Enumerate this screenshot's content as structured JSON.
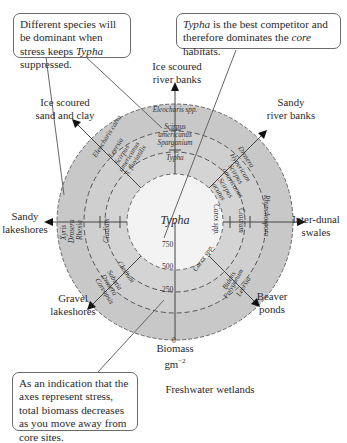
{
  "callouts": {
    "top_left": {
      "pre": "Different species will be dominant when stress keeps ",
      "em": "Typha",
      "post": " suppressed."
    },
    "top_right": {
      "em1": "Typha",
      "mid": " is the best competitor and therefore dominates the ",
      "em2": "core",
      "post": " habitats."
    },
    "bottom_left": {
      "text": "As an indication that the axes represent stress, total biomass decreases as you move away from core sites."
    }
  },
  "habitats": {
    "ice_river": {
      "line1": "Ice scoured",
      "line2": "river banks"
    },
    "sandy_river": {
      "line1": "Sandy",
      "line2": "river banks"
    },
    "ice_sand": {
      "line1": "Ice scoured",
      "line2": "sand and clay"
    },
    "sandy_lake": {
      "line1": "Sandy",
      "line2": "lakeshores"
    },
    "inter_dunal": {
      "line1": "Inter-dunal",
      "line2": "swales"
    },
    "gravel": {
      "line1": "Gravel",
      "line2": "lakeshores"
    },
    "beaver": {
      "line1": "Beaver",
      "line2": "ponds"
    }
  },
  "center_label": "Typha",
  "biomass_axis": {
    "label": "Biomass",
    "unit": "gm",
    "unit_sup": "−2",
    "ticks": [
      "750",
      "500",
      "250",
      "0"
    ]
  },
  "footer": "Freshwater wetlands",
  "species": {
    "n_outer": "Eleocharis spp.",
    "n_mid1": "Scirpus",
    "n_mid2": "americanus",
    "n_mid3": "Sparganium",
    "n_inner": "Typha",
    "nw_outer": "Eleocharis calva",
    "nw_a": "Leersia",
    "nw_b": "Scirpus",
    "nw_c": "americanus",
    "nw_d": "S. fluviatilis",
    "w_1": "Xyris",
    "w_2": "Drosera",
    "w_3": "Rhexia",
    "w_4": "Cladium",
    "sw_1": "Cladium",
    "sw_2": "Sabatia",
    "sw_3": "Drosera",
    "sw_4": "Coreopsis",
    "ne_1": "Drosera",
    "ne_2": "Hypericum",
    "ne_3": "Scirpus",
    "ne_4": "americanus",
    "ne_5": "Scirpus",
    "ne_6": "acutus",
    "e_1": "Carex spp.",
    "e_2": "Cladium",
    "e_3": "Rhynchospora",
    "se_1": "Carex spp.",
    "se_2": "Bidens",
    "se_3": "Polygonum",
    "se_4": "Leersia"
  },
  "colors": {
    "outer_ring": "#c9c9c9",
    "core": "#f2f2f2",
    "line": "#555555",
    "dash": "#555555"
  }
}
